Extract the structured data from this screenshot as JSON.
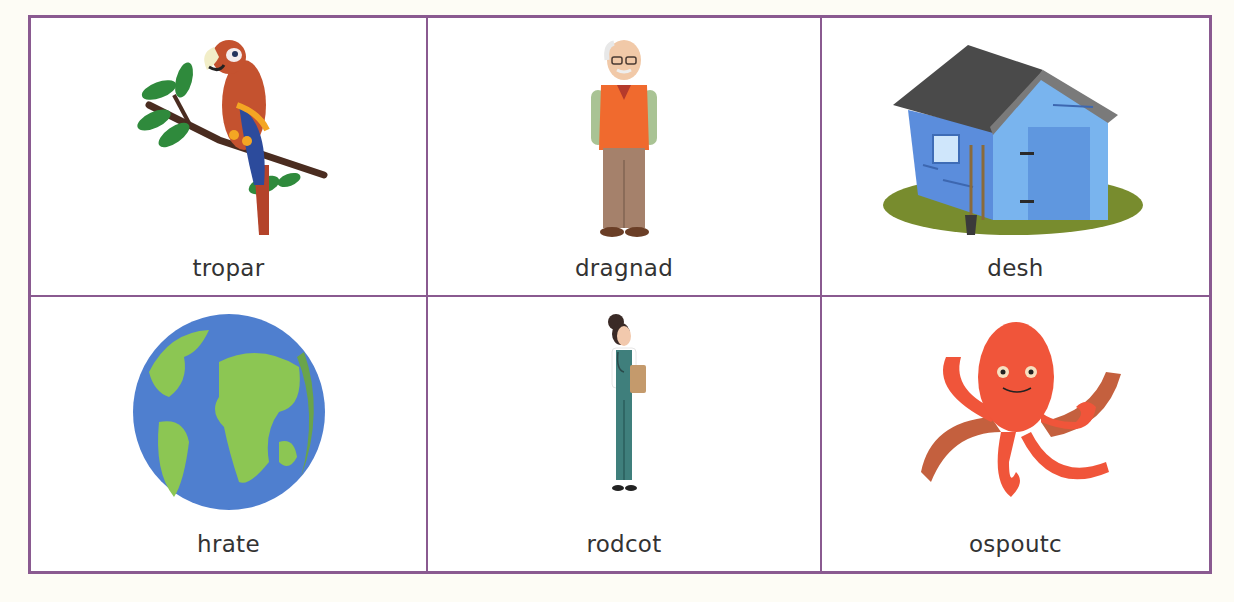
{
  "worksheet": {
    "border_color": "#8a5a90",
    "background": "#fdfcf5",
    "cards": [
      {
        "label": "tropar",
        "icon": "parrot-icon",
        "answer_hint": "parrot"
      },
      {
        "label": "dragnad",
        "icon": "grandad-icon",
        "answer_hint": "grandad"
      },
      {
        "label": "desh",
        "icon": "shed-icon",
        "answer_hint": "shed"
      },
      {
        "label": "hrate",
        "icon": "earth-globe-icon",
        "answer_hint": "earth"
      },
      {
        "label": "rodcot",
        "icon": "doctor-icon",
        "answer_hint": "doctor"
      },
      {
        "label": "ospoutc",
        "icon": "octopus-icon",
        "answer_hint": "octopus"
      }
    ]
  }
}
